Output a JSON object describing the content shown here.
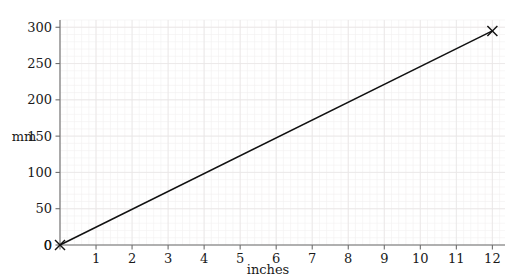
{
  "chart_data": {
    "type": "line",
    "title": "",
    "xlabel": "inches",
    "ylabel": "mm",
    "xlim": [
      0,
      12.35
    ],
    "ylim": [
      0,
      310
    ],
    "xticks": [
      0,
      1,
      2,
      3,
      4,
      5,
      6,
      7,
      8,
      9,
      10,
      11,
      12
    ],
    "yticks": [
      0,
      50,
      100,
      150,
      200,
      250,
      300
    ],
    "xtick_labels": [
      "0",
      "1",
      "2",
      "3",
      "4",
      "5",
      "6",
      "7",
      "8",
      "9",
      "10",
      "11",
      "12"
    ],
    "ytick_labels": [
      "0",
      "50",
      "100",
      "150",
      "200",
      "250",
      "300"
    ],
    "grid": true,
    "grid_minor": true,
    "legend": false,
    "series": [
      {
        "name": "inches to mm",
        "x": [
          0,
          12
        ],
        "values": [
          0,
          295
        ],
        "marker": "x",
        "color": "#111111"
      }
    ],
    "markers": [
      {
        "x": 0,
        "y": 0,
        "glyph": "x"
      },
      {
        "x": 12,
        "y": 295,
        "glyph": "x"
      }
    ],
    "colors": {
      "line": "#111111",
      "spine": "#6e6e6e",
      "grid_major": "#e9e6e6",
      "grid_minor": "#f2f0f0",
      "text": "#1a1a1a",
      "background": "#ffffff"
    }
  }
}
